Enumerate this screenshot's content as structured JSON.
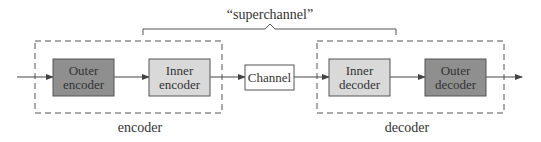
{
  "title_label": "“superchannel”",
  "colors": {
    "outer_fill": "#8f8f8f",
    "inner_fill": "#d9d9d9",
    "channel_fill": "#ffffff",
    "stroke": "#555555",
    "dashed": "#555555",
    "text": "#333333"
  },
  "groups": {
    "encoder": {
      "label": "encoder"
    },
    "decoder": {
      "label": "decoder"
    }
  },
  "blocks": {
    "outer_encoder": {
      "line1": "Outer",
      "line2": "encoder"
    },
    "inner_encoder": {
      "line1": "Inner",
      "line2": "encoder"
    },
    "channel": {
      "label": "Channel"
    },
    "inner_decoder": {
      "line1": "Inner",
      "line2": "decoder"
    },
    "outer_decoder": {
      "line1": "Outer",
      "line2": "decoder"
    }
  },
  "flow": [
    "input",
    "Outer encoder",
    "Inner encoder",
    "Channel",
    "Inner decoder",
    "Outer decoder",
    "output"
  ]
}
